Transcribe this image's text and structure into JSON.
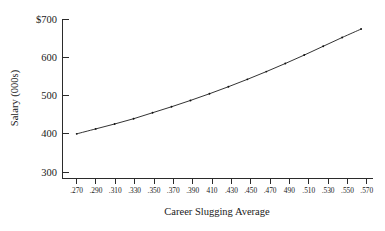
{
  "chart_data": {
    "type": "line",
    "title": "",
    "subtitle": "",
    "xlabel": "Career Slugging Average",
    "ylabel": "Salary (000s)",
    "xlim": [
      0.255,
      0.582
    ],
    "ylim": [
      260,
      715
    ],
    "grid": false,
    "legend": null,
    "markers": true,
    "marker_style": "small-dot",
    "line_color": "#1c1c1c",
    "background_color": "#ffffff",
    "x_tick_labels": [
      ".270",
      ".290",
      ".310",
      ".330",
      ".350",
      ".370",
      ".390",
      "410",
      ".430",
      ".450",
      ".470",
      "490",
      ".510",
      ".530",
      ".550",
      ".570"
    ],
    "x_tick_values": [
      0.27,
      0.29,
      0.31,
      0.33,
      0.35,
      0.37,
      0.39,
      0.41,
      0.43,
      0.45,
      0.47,
      0.49,
      0.51,
      0.53,
      0.55,
      0.57
    ],
    "y_tick_labels": [
      "300",
      "400",
      "500",
      "600",
      "$700"
    ],
    "y_tick_values": [
      300,
      400,
      500,
      600,
      700
    ],
    "x": [
      0.27,
      0.29,
      0.31,
      0.33,
      0.35,
      0.37,
      0.39,
      0.41,
      0.43,
      0.45,
      0.47,
      0.49,
      0.51,
      0.53,
      0.55,
      0.57
    ],
    "values": [
      387,
      401,
      415,
      430,
      447,
      464,
      482,
      501,
      521,
      542,
      564,
      587,
      611,
      636,
      661,
      685
    ],
    "series": [
      {
        "name": "Predicted Salary",
        "values": [
          387,
          401,
          415,
          430,
          447,
          464,
          482,
          501,
          521,
          542,
          564,
          587,
          611,
          636,
          661,
          685
        ]
      }
    ],
    "annotations": []
  },
  "figure": {
    "y_axis_title": "Salary (000s)",
    "x_axis_title": "Career Slugging Average"
  }
}
